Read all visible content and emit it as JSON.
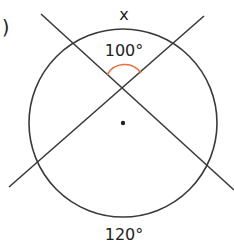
{
  "figure": {
    "paren": ")",
    "labels": {
      "arc_top": "x",
      "angle_at_intersection": "100°",
      "arc_bottom": "120°"
    },
    "colors": {
      "stroke": "#3a3a3a",
      "angle_mark": "#e8703a",
      "text": "#222222"
    },
    "circle": {
      "cx": 123,
      "cy": 123,
      "r": 94
    },
    "center_dot": {
      "cx": 123,
      "cy": 123
    },
    "intersection": {
      "x": 122,
      "y": 89
    },
    "lines": [
      {
        "name": "secant-a",
        "x1": 41,
        "y1": 14,
        "x2": 234,
        "y2": 190
      },
      {
        "name": "secant-b",
        "x1": 204,
        "y1": 16,
        "x2": 9,
        "y2": 187
      }
    ]
  }
}
